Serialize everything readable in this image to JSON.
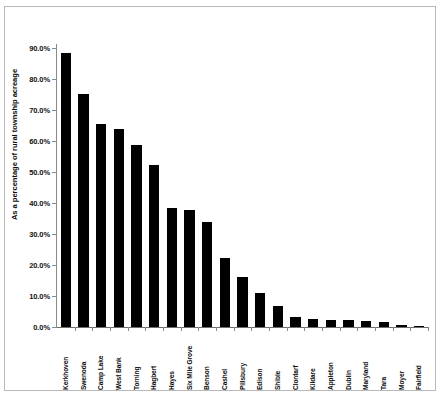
{
  "chart_data": {
    "type": "bar",
    "title": "",
    "xlabel": "",
    "ylabel": "As a percentage of rural township acreage",
    "ylim": [
      0,
      90
    ],
    "ytick_labels": [
      "90.0%",
      "80.0%",
      "70.0%",
      "60.0%",
      "50.0%",
      "40.0%",
      "30.0%",
      "20.0%",
      "10.0%",
      "0.0%"
    ],
    "ytick_values": [
      90,
      80,
      70,
      60,
      50,
      40,
      30,
      20,
      10,
      0
    ],
    "grid": false,
    "legend": "none",
    "bar_color": "#000000",
    "categories": [
      "Kerkhoven",
      "Swenoda",
      "Camp Lake",
      "West Bank",
      "Torning",
      "Hagbert",
      "Hayes",
      "Six Mile Grove",
      "Benson",
      "Cashel",
      "Pillsbury",
      "Edison",
      "Shible",
      "Clontarf",
      "Kildare",
      "Appleton",
      "Dublin",
      "Maryland",
      "Tara",
      "Moyer",
      "Fairfield"
    ],
    "values": [
      88.5,
      75.3,
      65.5,
      63.8,
      58.8,
      52.3,
      38.3,
      37.8,
      34.0,
      22.3,
      16.0,
      11.0,
      6.8,
      3.3,
      2.6,
      2.3,
      2.2,
      2.0,
      1.5,
      0.8,
      0.2
    ]
  }
}
